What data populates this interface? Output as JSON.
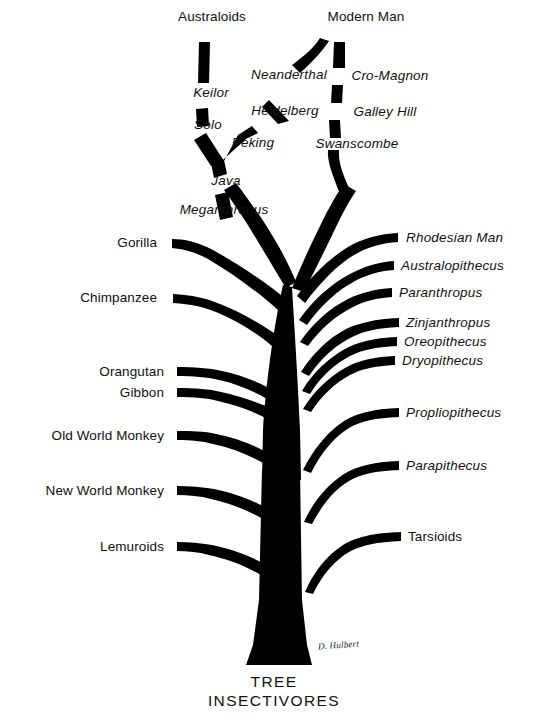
{
  "figure": {
    "ink_color": "#000000",
    "background_color": "#ffffff",
    "signature": "D. Hulbert"
  },
  "root": {
    "line1": "TREE",
    "line2": "INSECTIVORES"
  },
  "crown_left_lineage": {
    "top_label": "Australoids",
    "nodes": [
      {
        "label": "Keilor",
        "style": "italic"
      },
      {
        "label": "Solo",
        "style": "italic"
      },
      {
        "label": "Peking",
        "style": "italic"
      },
      {
        "label": "Java",
        "style": "italic"
      },
      {
        "label": "Meganthropus",
        "style": "italic"
      }
    ]
  },
  "crown_right_lineage": {
    "top_label": "Modern Man",
    "nodes": [
      {
        "label": "Neanderthal",
        "style": "italic"
      },
      {
        "label": "Cro-Magnon",
        "style": "italic"
      },
      {
        "label": "Heidelberg",
        "style": "italic"
      },
      {
        "label": "Galley Hill",
        "style": "italic"
      },
      {
        "label": "Swanscombe",
        "style": "italic"
      }
    ]
  },
  "left_branches": [
    {
      "label": "Gorilla",
      "style": "roman",
      "x": 157,
      "y": 243
    },
    {
      "label": "Chimpanzee",
      "style": "roman",
      "x": 157,
      "y": 297
    },
    {
      "label": "Orangutan",
      "style": "roman",
      "x": 164,
      "y": 372
    },
    {
      "label": "Gibbon",
      "style": "roman",
      "x": 164,
      "y": 393
    },
    {
      "label": "Old World Monkey",
      "style": "roman",
      "x": 164,
      "y": 437
    },
    {
      "label": "New World Monkey",
      "style": "roman",
      "x": 164,
      "y": 493
    },
    {
      "label": "Lemuroids",
      "style": "roman",
      "x": 164,
      "y": 548
    }
  ],
  "right_branches": [
    {
      "label": "Rhodesian Man",
      "style": "italic",
      "x": 406,
      "y": 238
    },
    {
      "label": "Australopithecus",
      "style": "italic",
      "x": 401,
      "y": 260
    },
    {
      "label": "Paranthropus",
      "style": "italic",
      "x": 399,
      "y": 281
    },
    {
      "label": "Zinjanthropus",
      "style": "italic",
      "x": 406,
      "y": 312
    },
    {
      "label": "Oreopithecus",
      "style": "italic",
      "x": 404,
      "y": 331
    },
    {
      "label": "Dryopithecus",
      "style": "italic",
      "x": 402,
      "y": 350
    },
    {
      "label": "Propliopithecus",
      "style": "italic",
      "x": 406,
      "y": 410
    },
    {
      "label": "Parapithecus",
      "style": "italic",
      "x": 406,
      "y": 462
    },
    {
      "label": "Tarsioids",
      "style": "roman",
      "x": 408,
      "y": 533
    }
  ],
  "crown_label_positions": {
    "australoids": {
      "x": 212,
      "y": 17
    },
    "modern_man": {
      "x": 366,
      "y": 17
    },
    "keilor": {
      "x": 211,
      "y": 93
    },
    "solo": {
      "x": 208,
      "y": 125
    },
    "peking": {
      "x": 253,
      "y": 143
    },
    "java": {
      "x": 226,
      "y": 181
    },
    "meganthropus": {
      "x": 224,
      "y": 210
    },
    "neanderthal": {
      "x": 289,
      "y": 75
    },
    "cro_magnon": {
      "x": 390,
      "y": 76
    },
    "heidelberg": {
      "x": 285,
      "y": 111
    },
    "galley_hill": {
      "x": 385,
      "y": 112
    },
    "swanscombe": {
      "x": 357,
      "y": 144
    }
  }
}
